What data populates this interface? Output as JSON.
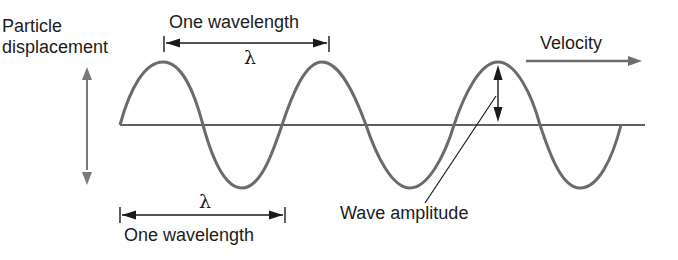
{
  "diagram": {
    "labels": {
      "particle_displacement_line1": "Particle",
      "particle_displacement_line2": "displacement",
      "wavelength_top": "One wavelength",
      "lambda_top": "λ",
      "velocity": "Velocity",
      "wavelength_bottom": "One wavelength",
      "lambda_bottom": "λ",
      "wave_amplitude": "Wave amplitude"
    },
    "colors": {
      "wave": "#6b6b6b",
      "axis": "#2a2a2a",
      "displacement_arrow": "#7a7a7a",
      "velocity_arrow": "#6e6e6e",
      "text": "#1c1c1c"
    },
    "geometry": {
      "baseline_y": 125,
      "axis_x_start": 120,
      "axis_x_end": 645,
      "peaks_x": [
        163,
        322,
        498
      ],
      "troughs_x": [
        242,
        410,
        580
      ],
      "peak_y": 62,
      "trough_y": 188
    }
  }
}
